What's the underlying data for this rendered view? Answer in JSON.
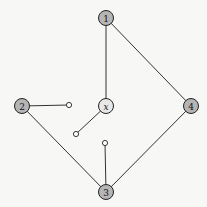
{
  "diagram": {
    "colors": {
      "background": "#f7f7f5",
      "edge": "#333333",
      "node_fill": "#b5b5b5",
      "node_fill_x": "#e8e8e8",
      "node_stroke": "#222222",
      "stub_fill": "#ffffff"
    },
    "nodes": [
      {
        "id": "1",
        "label": "1",
        "x": 106,
        "y": 18
      },
      {
        "id": "2",
        "label": "2",
        "x": 22,
        "y": 106
      },
      {
        "id": "x",
        "label": "x",
        "x": 106,
        "y": 106
      },
      {
        "id": "4",
        "label": "4",
        "x": 191,
        "y": 106
      },
      {
        "id": "3",
        "label": "3",
        "x": 106,
        "y": 192
      }
    ],
    "stubs": [
      {
        "id": "s2",
        "x": 69,
        "y": 105
      },
      {
        "id": "sx",
        "x": 76,
        "y": 134
      },
      {
        "id": "s3",
        "x": 105,
        "y": 143
      }
    ],
    "edges": [
      {
        "from": "1",
        "to": "x"
      },
      {
        "from": "1",
        "to": "4"
      },
      {
        "from": "4",
        "to": "3"
      },
      {
        "from": "2",
        "to": "3"
      },
      {
        "from": "2",
        "to": "s2"
      },
      {
        "from": "x",
        "to": "sx"
      },
      {
        "from": "3",
        "to": "s3"
      }
    ]
  }
}
